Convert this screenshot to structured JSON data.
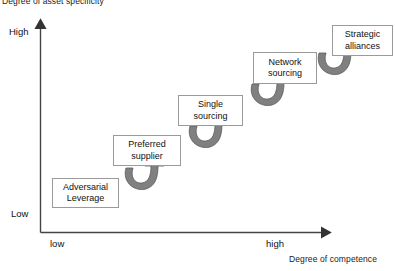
{
  "diagram": {
    "y_axis": {
      "title": "Degree of asset specificity",
      "high_label": "High",
      "low_label": "Low"
    },
    "x_axis": {
      "title": "Degree of competence",
      "low_label": "low",
      "high_label": "high"
    },
    "colors": {
      "axis": "#444444",
      "box_border": "#9a9a9a",
      "box_fill": "#ffffff",
      "arrow_fill": "#808080",
      "arrow_stroke": "#5a5a5a",
      "text": "#111111",
      "background": "#ffffff"
    },
    "boxes": [
      {
        "id": "adversarial-leverage",
        "line1": "Adversarial",
        "line2": "Leverage",
        "x": 52,
        "y": 178,
        "w": 67,
        "h": 30
      },
      {
        "id": "preferred-supplier",
        "line1": "Preferred",
        "line2": "supplier",
        "x": 113,
        "y": 135,
        "w": 68,
        "h": 31
      },
      {
        "id": "single-sourcing",
        "line1": "Single",
        "line2": "sourcing",
        "x": 178,
        "y": 95,
        "w": 65,
        "h": 31
      },
      {
        "id": "network-sourcing",
        "line1": "Network",
        "line2": "sourcing",
        "x": 253,
        "y": 52,
        "w": 64,
        "h": 32
      },
      {
        "id": "strategic-alliances",
        "line1": "Strategic",
        "line2": "alliances",
        "x": 332,
        "y": 25,
        "w": 61,
        "h": 31
      }
    ],
    "arrows": [
      {
        "id": "arrow-adversarial-to-preferred",
        "x": 126,
        "y": 158
      },
      {
        "id": "arrow-preferred-to-single",
        "x": 190,
        "y": 116
      },
      {
        "id": "arrow-single-to-network",
        "x": 252,
        "y": 72
      },
      {
        "id": "arrow-network-to-strategic",
        "x": 319,
        "y": 40
      }
    ]
  }
}
